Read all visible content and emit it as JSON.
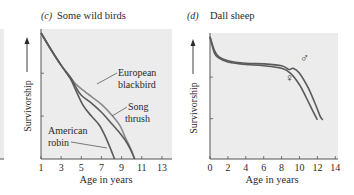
{
  "colors": {
    "plot_bg": "#ececec",
    "axis": "#555555",
    "curve": "#5a5a5a",
    "curve_light": "#8a8a8a",
    "text": "#2a2a2a"
  },
  "chart_data": [
    {
      "type": "line",
      "panel_label": "(c)",
      "title": "Some wild birds",
      "xlabel": "Age in years",
      "ylabel": "Survivorship",
      "ylabel_arrow": true,
      "y_scale": "log (unlabeled)",
      "xlim": [
        1,
        14
      ],
      "ylim": [
        0,
        1
      ],
      "x_ticks": [
        1,
        3,
        5,
        7,
        9,
        11,
        13
      ],
      "y_ticks_frac": [
        0.33,
        0.66
      ],
      "grid": false,
      "legend": "inline labels",
      "series": [
        {
          "name": "European blackbird",
          "label_lines": [
            "European",
            "blackbird"
          ],
          "x": [
            1,
            2,
            3,
            4,
            4.4,
            5,
            6,
            7,
            8,
            8.8,
            9.4,
            9.9,
            10.3
          ],
          "y": [
            0.97,
            0.84,
            0.72,
            0.62,
            0.58,
            0.54,
            0.48,
            0.42,
            0.34,
            0.26,
            0.16,
            0.08,
            0
          ]
        },
        {
          "name": "Song thrush",
          "label_lines": [
            "Song",
            "thrush"
          ],
          "x": [
            1,
            2,
            3,
            4,
            4.4,
            5,
            6,
            7,
            7.8,
            8.6,
            9.4,
            9.9,
            10.3
          ],
          "y": [
            0.97,
            0.84,
            0.72,
            0.62,
            0.56,
            0.49,
            0.43,
            0.36,
            0.29,
            0.22,
            0.14,
            0.07,
            0
          ]
        },
        {
          "name": "American robin",
          "label_lines": [
            "American",
            "robin"
          ],
          "x": [
            1,
            2,
            3,
            3.9,
            4.5,
            5.2,
            6,
            6.8,
            7.4,
            7.9,
            8.3
          ],
          "y": [
            0.97,
            0.84,
            0.72,
            0.62,
            0.52,
            0.41,
            0.33,
            0.26,
            0.17,
            0.08,
            0
          ]
        }
      ]
    },
    {
      "type": "line",
      "panel_label": "(d)",
      "title": "Dall sheep",
      "xlabel": "Age in years",
      "ylabel": "Survivorship",
      "ylabel_arrow": true,
      "y_scale": "log (unlabeled)",
      "xlim": [
        0,
        14.3
      ],
      "ylim": [
        0,
        1
      ],
      "x_ticks": [
        0,
        2,
        4,
        6,
        8,
        10,
        12,
        14
      ],
      "y_ticks_frac": [
        0.32,
        0.65
      ],
      "grid": false,
      "legend": "inline symbols",
      "series": [
        {
          "name": "Male",
          "symbol": "♂",
          "x": [
            0,
            0.5,
            1,
            2,
            4,
            6,
            8,
            8.8,
            9.3,
            10,
            11,
            11.8,
            12.3,
            12.6
          ],
          "y": [
            0.97,
            0.86,
            0.81,
            0.78,
            0.76,
            0.755,
            0.74,
            0.71,
            0.72,
            0.68,
            0.56,
            0.43,
            0.34,
            0.31
          ]
        },
        {
          "name": "Female",
          "symbol": "♀",
          "x": [
            0,
            0.5,
            1,
            2,
            4,
            6,
            8,
            9,
            10,
            10.8,
            11.5,
            12.0
          ],
          "y": [
            0.97,
            0.84,
            0.8,
            0.77,
            0.75,
            0.74,
            0.72,
            0.68,
            0.59,
            0.48,
            0.38,
            0.31
          ]
        }
      ]
    }
  ],
  "panels": [
    {
      "label": "(c)",
      "title": "Some wild birds",
      "xlabel": "Age in years",
      "ylabel": "Survivorship",
      "labels": {
        "blackbird_1": "European",
        "blackbird_2": "blackbird",
        "thrush_1": "Song",
        "thrush_2": "thrush",
        "robin_1": "American",
        "robin_2": "robin"
      }
    },
    {
      "label": "(d)",
      "title": "Dall sheep",
      "xlabel": "Age in years",
      "ylabel": "Survivorship",
      "labels": {
        "male": "♂",
        "female": "♀"
      }
    }
  ]
}
